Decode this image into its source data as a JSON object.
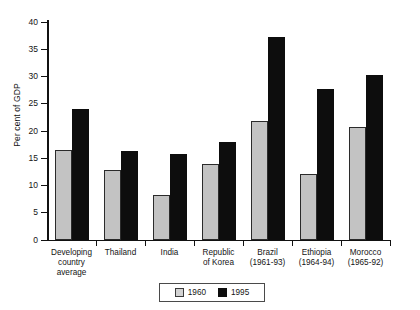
{
  "chart_data": {
    "type": "bar",
    "title": "",
    "subtitle": "",
    "xlabel": "",
    "ylabel": "Per cent of GDP",
    "ylim": [
      0,
      40
    ],
    "yticks": [
      0,
      5,
      10,
      15,
      20,
      25,
      30,
      35,
      40
    ],
    "ytick_labels": [
      "0",
      "5",
      "10",
      "15",
      "20",
      "25",
      "30",
      "35",
      "40"
    ],
    "grid": false,
    "legend_position": "bottom-center",
    "categories": [
      "Developing country average",
      "Thailand",
      "India",
      "Republic of Korea",
      "Brazil (1961-93)",
      "Ethiopia (1964-94)",
      "Morocco (1965-92)"
    ],
    "category_label_lines": [
      [
        "Developing",
        "country",
        "average"
      ],
      [
        "Thailand"
      ],
      [
        "India"
      ],
      [
        "Republic",
        "of Korea"
      ],
      [
        "Brazil",
        "(1961-93)"
      ],
      [
        "Ethiopia",
        "(1964-94)"
      ],
      [
        "Morocco",
        "(1965-92)"
      ]
    ],
    "series": [
      {
        "name": "1960",
        "color": "#c3c3c3",
        "values": [
          16.5,
          12.8,
          8.3,
          14.0,
          21.8,
          12.2,
          20.7
        ]
      },
      {
        "name": "1995",
        "color": "#0d0d0d",
        "values": [
          24.0,
          16.3,
          15.7,
          18.0,
          37.2,
          27.7,
          30.2
        ]
      }
    ]
  },
  "legend": {
    "entries": [
      {
        "label": "1960",
        "swatch": "light-gray-swatch"
      },
      {
        "label": "1995",
        "swatch": "black-swatch"
      }
    ]
  },
  "colors": {
    "series_1960": "#c3c3c3",
    "series_1995": "#0d0d0d",
    "axis": "#111111",
    "background": "#ffffff"
  }
}
